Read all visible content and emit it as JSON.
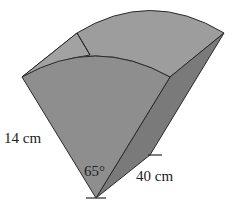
{
  "figure": {
    "type": "sector-prism",
    "labels": {
      "radius": "14 cm",
      "angle": "65°",
      "length": "40 cm"
    },
    "values": {
      "radius_cm": 14,
      "angle_deg": 65,
      "length_cm": 40
    },
    "colors": {
      "front_face": "#8e8e8e",
      "top_face": "#9d9d9d",
      "left_back_face": "#a2a2a2",
      "side_face": "#7a7a7a",
      "edge": "#2a2a2a"
    }
  }
}
